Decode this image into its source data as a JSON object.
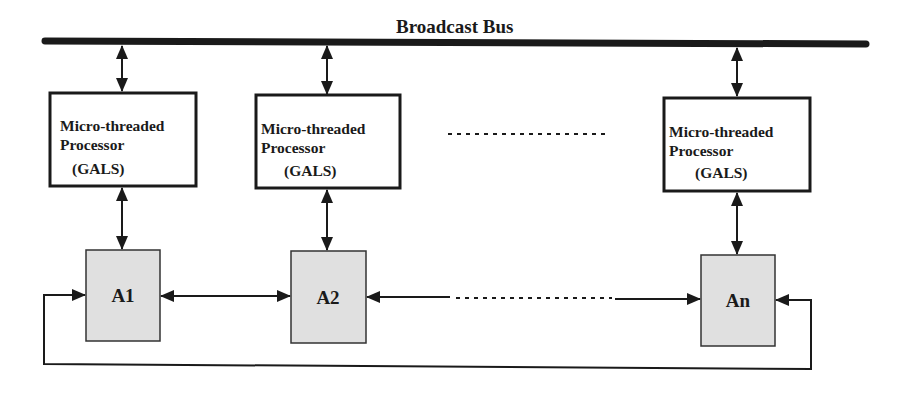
{
  "diagram": {
    "title": "Broadcast Bus",
    "colors": {
      "stroke": "#1a1a1a",
      "accelerator_fill": "#e0e0e0",
      "processor_fill": "#ffffff"
    },
    "processors": [
      {
        "line1": "Micro-threaded",
        "line2": "Processor",
        "line3": "(GALS)"
      },
      {
        "line1": "Micro-threaded",
        "line2": "Processor",
        "line3": "(GALS)"
      },
      {
        "line1": "Micro-threaded",
        "line2": "Processor",
        "line3": "(GALS)"
      }
    ],
    "accelerators": [
      {
        "label": "A1"
      },
      {
        "label": "A2"
      },
      {
        "label": "An"
      }
    ],
    "ellipsis_between_processors": "dotted-line",
    "ellipsis_between_accelerators": "dotted-line"
  }
}
